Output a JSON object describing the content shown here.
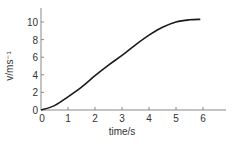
{
  "chart_data": {
    "type": "line",
    "title": "",
    "xlabel": "time/s",
    "ylabel": "v/ms⁻¹",
    "xlim": [
      0,
      7
    ],
    "ylim": [
      0,
      11
    ],
    "x_ticks": [
      "0",
      "1",
      "2",
      "3",
      "4",
      "5",
      "6"
    ],
    "y_ticks": [
      "0",
      "2",
      "4",
      "6",
      "8",
      "10"
    ],
    "grid": false,
    "legend": null,
    "series": [
      {
        "name": "velocity",
        "x": [
          0,
          0.5,
          1,
          1.5,
          2,
          2.5,
          3,
          3.5,
          4,
          4.5,
          5,
          5.5,
          5.9
        ],
        "y": [
          0,
          0.5,
          1.5,
          2.6,
          3.9,
          5.1,
          6.2,
          7.4,
          8.5,
          9.4,
          10.0,
          10.25,
          10.3
        ]
      }
    ],
    "colors": {
      "line": "#1a1a1a",
      "axis": "#555555"
    }
  }
}
